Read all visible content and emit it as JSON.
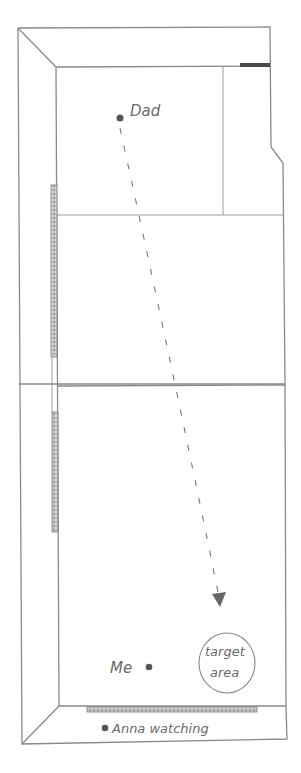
{
  "diagram": {
    "type": "hand-drawn floor plan",
    "labels": {
      "dad": "Dad",
      "me": "Me",
      "target_line1": "target",
      "target_line2": "area",
      "anna": "Anna watching"
    },
    "points": {
      "dad": {
        "x": 120,
        "y": 118
      },
      "me": {
        "x": 149,
        "y": 667
      },
      "anna": {
        "x": 105,
        "y": 728
      },
      "arrow_tip": {
        "x": 220,
        "y": 607
      }
    },
    "target_circle": {
      "cx": 227,
      "cy": 663,
      "r": 29
    },
    "colors": {
      "line": "#8a8a8a",
      "dot": "#555555",
      "text": "#6a6a6a",
      "dark_bar": "#4a4a4a"
    }
  }
}
